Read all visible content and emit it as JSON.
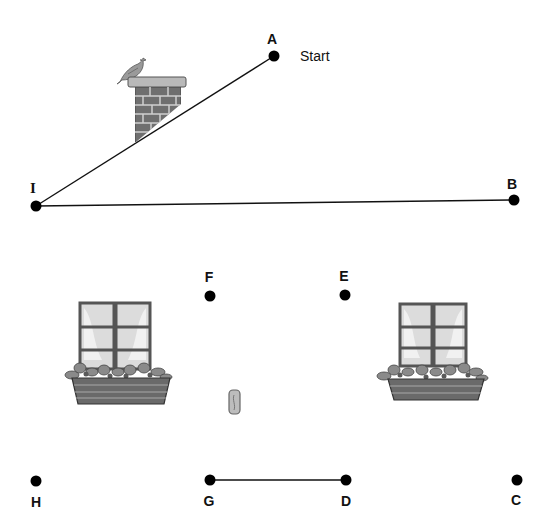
{
  "puzzle": {
    "type": "connect-the-dots",
    "start_label": "Start",
    "points": [
      {
        "id": "A",
        "label": "A",
        "x": 274,
        "y": 56,
        "label_x": 272,
        "label_y": 32,
        "label_pos": "above"
      },
      {
        "id": "B",
        "label": "B",
        "x": 514,
        "y": 200,
        "label_x": 512,
        "label_y": 177,
        "label_pos": "above"
      },
      {
        "id": "C",
        "label": "C",
        "x": 517,
        "y": 480,
        "label_x": 516,
        "label_y": 493,
        "label_pos": "below"
      },
      {
        "id": "D",
        "label": "D",
        "x": 346,
        "y": 480,
        "label_x": 346,
        "label_y": 494,
        "label_pos": "below"
      },
      {
        "id": "E",
        "label": "E",
        "x": 345,
        "y": 295,
        "label_x": 344,
        "label_y": 269,
        "label_pos": "above"
      },
      {
        "id": "F",
        "label": "F",
        "x": 210,
        "y": 296,
        "label_x": 209,
        "label_y": 270,
        "label_pos": "above"
      },
      {
        "id": "G",
        "label": "G",
        "x": 210,
        "y": 480,
        "label_x": 209,
        "label_y": 494,
        "label_pos": "below"
      },
      {
        "id": "H",
        "label": "H",
        "x": 36,
        "y": 481,
        "label_x": 36,
        "label_y": 495,
        "label_pos": "below"
      },
      {
        "id": "I",
        "label": "I",
        "x": 36,
        "y": 206,
        "label_x": 33,
        "label_y": 181,
        "label_pos": "above"
      }
    ],
    "drawn_segments": [
      {
        "from": "A",
        "to": "I"
      },
      {
        "from": "I",
        "to": "B"
      },
      {
        "from": "G",
        "to": "D"
      }
    ],
    "illustrations": [
      {
        "name": "chimney-with-bird",
        "x": 116,
        "y": 55
      },
      {
        "name": "window-with-flower-box-left",
        "x": 66,
        "y": 300
      },
      {
        "name": "window-with-flower-box-right",
        "x": 376,
        "y": 300
      },
      {
        "name": "door-handle",
        "x": 228,
        "y": 390
      }
    ]
  }
}
